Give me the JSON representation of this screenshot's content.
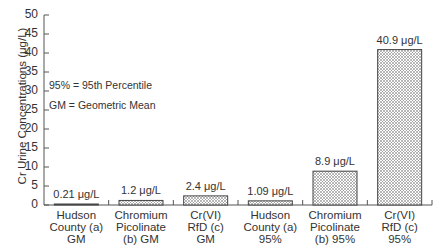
{
  "chart_data": {
    "type": "bar",
    "title": "",
    "xlabel": "",
    "ylabel": "Cr Urine Concentrations (μg/L)",
    "ylim": [
      0,
      50
    ],
    "yticks": [
      0,
      5,
      10,
      15,
      20,
      25,
      30,
      35,
      40,
      45,
      50
    ],
    "grid": false,
    "categories": [
      "Hudson County (a) GM",
      "Chromium Picolinate (b) GM",
      "Cr(VI) RfD (c) GM",
      "Hudson County (a) 95%",
      "Chromium Picolinate (b) 95%",
      "Cr(VI) RfD (c) 95%"
    ],
    "values": [
      0.21,
      1.2,
      2.4,
      1.09,
      8.9,
      40.9
    ],
    "value_labels": [
      "0.21 μg/L",
      "1.2 μg/L",
      "2.4 μg/L",
      "1.09 μg/L",
      "8.9 μg/L",
      "40.9 μg/L"
    ],
    "annotations": [
      "95% = 95th Percentile",
      "GM = Geometric Mean"
    ],
    "bar_fill": "crosshatch"
  },
  "labels": {
    "cat": [
      "Hudson\nCounty (a)\nGM",
      "Chromium\nPicolinate\n(b) GM",
      "Cr(VI)\nRfD (c)\nGM",
      "Hudson\nCounty (a)\n95%",
      "Chromium\nPicolinate\n(b) 95%",
      "Cr(VI)\nRfD (c)\n95%"
    ]
  }
}
